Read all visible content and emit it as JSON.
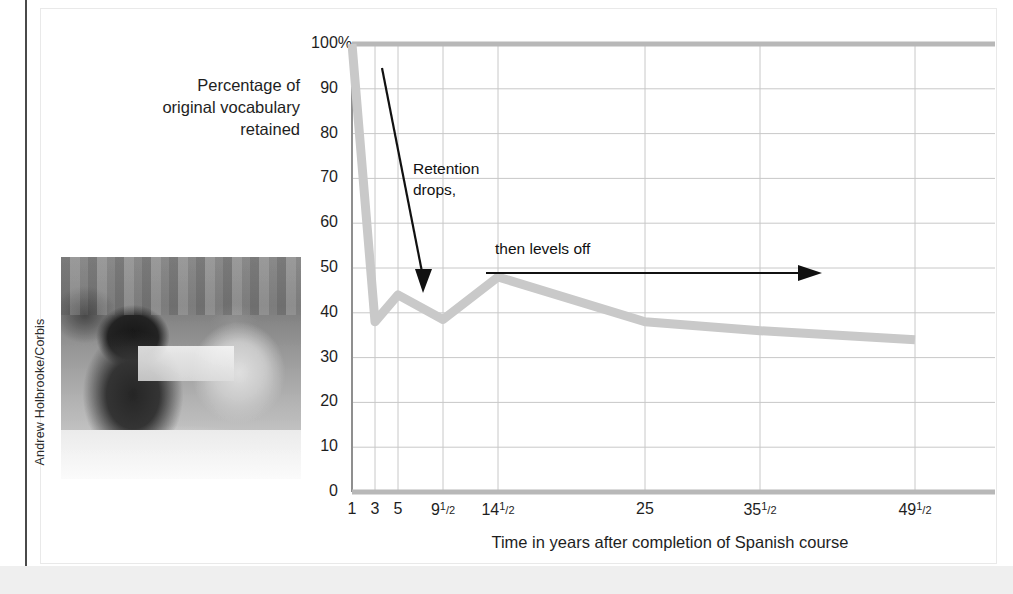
{
  "figure": {
    "photo_credit": "Andrew Holbrooke/Corbis",
    "photo_alt": "students wearing headphones in a language lab classroom"
  },
  "annotations": [
    {
      "id": "retention-drops",
      "text": "Retention\ndrops,",
      "line1": "Retention",
      "line2": "drops,"
    },
    {
      "id": "levels-off",
      "text": "then levels off"
    }
  ],
  "chart_data": {
    "type": "line",
    "title": "",
    "xlabel": "Time in years after completion of Spanish course",
    "ylabel": "Percentage of original vocabulary retained",
    "ylabel_lines": [
      "Percentage of",
      "original vocabulary",
      "retained"
    ],
    "ylim": [
      0,
      100
    ],
    "yticks": [
      0,
      10,
      20,
      30,
      40,
      50,
      60,
      70,
      80,
      90,
      100
    ],
    "ytick_labels": [
      "0",
      "10",
      "20",
      "30",
      "40",
      "50",
      "60",
      "70",
      "80",
      "90",
      "100%"
    ],
    "xtick_labels": [
      "1",
      "3",
      "5",
      "9½",
      "14½",
      "25",
      "35½",
      "49½"
    ],
    "xtick_labels_html": [
      "1",
      "3",
      "5",
      "9<sup>1</sup><sub>/2</sub>",
      "14<sup>1</sup><sub>/2</sub>",
      "25",
      "35<sup>1</sup><sub>/2</sub>",
      "49<sup>1</sup><sub>/2</sub>"
    ],
    "x": [
      1,
      3,
      5,
      9.5,
      14.5,
      25,
      35.5,
      49.5
    ],
    "values": [
      100,
      38,
      44,
      38.5,
      48,
      38,
      36,
      34
    ],
    "grid": true,
    "legend": "none",
    "line_color": "#c9c9c9",
    "axis_color": "#b8b8b8",
    "grid_color": "#c8c8c8",
    "annotation_color": "#111111"
  },
  "colors": {
    "panel_background": "#ffffff",
    "bottom_band": "#efefef",
    "left_rule": "#4a4a4a",
    "text": "#1e1e1e"
  }
}
